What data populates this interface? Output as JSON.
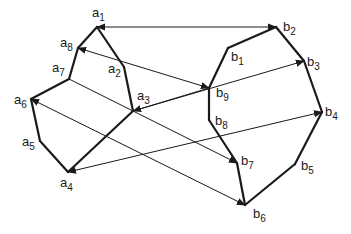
{
  "diagram": {
    "type": "polygon-matching",
    "polygon_a": {
      "vertices": [
        {
          "id": "a1",
          "letter": "a",
          "index": "1",
          "x": 97,
          "y": 27,
          "lx": 92,
          "ly": 6
        },
        {
          "id": "a2",
          "letter": "a",
          "index": "2",
          "x": 124,
          "y": 67,
          "lx": 108,
          "ly": 62
        },
        {
          "id": "a3",
          "letter": "a",
          "index": "3",
          "x": 133,
          "y": 111,
          "lx": 137,
          "ly": 89
        },
        {
          "id": "a4",
          "letter": "a",
          "index": "4",
          "x": 68,
          "y": 172,
          "lx": 60,
          "ly": 176
        },
        {
          "id": "a5",
          "letter": "a",
          "index": "5",
          "x": 40,
          "y": 141,
          "lx": 22,
          "ly": 135
        },
        {
          "id": "a6",
          "letter": "a",
          "index": "6",
          "x": 31,
          "y": 99,
          "lx": 14,
          "ly": 93
        },
        {
          "id": "a7",
          "letter": "a",
          "index": "7",
          "x": 69,
          "y": 79,
          "lx": 52,
          "ly": 61
        },
        {
          "id": "a8",
          "letter": "a",
          "index": "8",
          "x": 78,
          "y": 48,
          "lx": 60,
          "ly": 36
        }
      ],
      "edges": [
        [
          "a1",
          "a2"
        ],
        [
          "a2",
          "a3"
        ],
        [
          "a3",
          "a4"
        ],
        [
          "a4",
          "a5"
        ],
        [
          "a5",
          "a6"
        ],
        [
          "a6",
          "a7"
        ],
        [
          "a7",
          "a8"
        ],
        [
          "a8",
          "a1"
        ]
      ]
    },
    "polygon_b": {
      "vertices": [
        {
          "id": "b1",
          "letter": "b",
          "index": "1",
          "x": 228,
          "y": 48,
          "lx": 231,
          "ly": 50
        },
        {
          "id": "b2",
          "letter": "b",
          "index": "2",
          "x": 276,
          "y": 27,
          "lx": 283,
          "ly": 20
        },
        {
          "id": "b3",
          "letter": "b",
          "index": "3",
          "x": 304,
          "y": 61,
          "lx": 307,
          "ly": 55
        },
        {
          "id": "b4",
          "letter": "b",
          "index": "4",
          "x": 322,
          "y": 112,
          "lx": 325,
          "ly": 105
        },
        {
          "id": "b5",
          "letter": "b",
          "index": "5",
          "x": 295,
          "y": 164,
          "lx": 301,
          "ly": 159
        },
        {
          "id": "b6",
          "letter": "b",
          "index": "6",
          "x": 245,
          "y": 205,
          "lx": 253,
          "ly": 207
        },
        {
          "id": "b7",
          "letter": "b",
          "index": "7",
          "x": 237,
          "y": 163,
          "lx": 241,
          "ly": 154
        },
        {
          "id": "b8",
          "letter": "b",
          "index": "8",
          "x": 209,
          "y": 120,
          "lx": 215,
          "ly": 114
        },
        {
          "id": "b9",
          "letter": "b",
          "index": "9",
          "x": 209,
          "y": 88,
          "lx": 216,
          "ly": 86
        }
      ],
      "edges": [
        [
          "b1",
          "b2"
        ],
        [
          "b2",
          "b3"
        ],
        [
          "b3",
          "b4"
        ],
        [
          "b4",
          "b5"
        ],
        [
          "b5",
          "b6"
        ],
        [
          "b6",
          "b7"
        ],
        [
          "b7",
          "b8"
        ],
        [
          "b8",
          "b9"
        ],
        [
          "b9",
          "b1"
        ]
      ]
    },
    "arrows": [
      {
        "from": "b2",
        "to": "a1",
        "heads": [
          "a1",
          "b2"
        ]
      },
      {
        "from": "b9",
        "to": "a8",
        "heads": [
          "a8",
          "b9"
        ]
      },
      {
        "from": "b9",
        "to": "a3",
        "heads": [
          "a3"
        ]
      },
      {
        "from": "a3",
        "to": "b3",
        "heads": [
          "b3"
        ]
      },
      {
        "from": "a7",
        "to": "b7",
        "heads": [
          "b7"
        ]
      },
      {
        "from": "b6",
        "to": "a6",
        "heads": [
          "a6",
          "b6"
        ]
      },
      {
        "from": "b4",
        "to": "a4",
        "heads": [
          "a4",
          "b4"
        ]
      }
    ],
    "colors": {
      "stroke": "#1a1a1a",
      "background": "#ffffff"
    }
  }
}
